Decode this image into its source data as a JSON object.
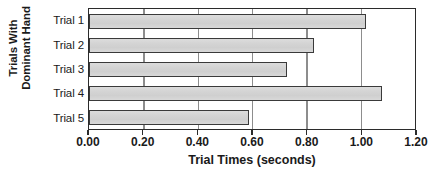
{
  "chart_data": {
    "type": "bar",
    "orientation": "horizontal",
    "title": "",
    "categories": [
      "Trial 1",
      "Trial 2",
      "Trial 3",
      "Trial 4",
      "Trial 5"
    ],
    "values": [
      1.02,
      0.83,
      0.73,
      1.08,
      0.59
    ],
    "xlabel": "Trial Times (seconds)",
    "ylabel": "Trials With Dominant Hand",
    "ylabel_line1": "Trials With",
    "ylabel_line2": "Dominant Hand",
    "xlim": [
      0.0,
      1.2
    ],
    "xticks": [
      0.0,
      0.2,
      0.4,
      0.6,
      0.8,
      1.0,
      1.2
    ],
    "xtick_labels": [
      "0.00",
      "0.20",
      "0.40",
      "0.60",
      "0.80",
      "1.00",
      "1.20"
    ],
    "grid": "vertical",
    "legend": "none",
    "bar_fill_color": "#d2d2d2",
    "bar_border_color": "#3a3a3a",
    "gridline_color": "#8d8d8d",
    "axis_color": "#2b2b2b"
  },
  "labels": {
    "trial_1": "Trial 1",
    "trial_2": "Trial 2",
    "trial_3": "Trial 3",
    "trial_4": "Trial 4",
    "trial_5": "Trial 5"
  }
}
